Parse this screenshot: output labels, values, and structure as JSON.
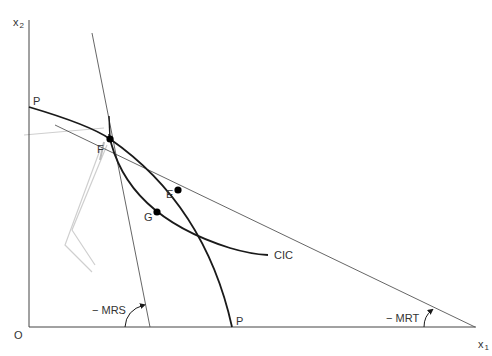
{
  "diagram": {
    "type": "economics-production-possibility",
    "axes": {
      "origin_label": "O",
      "x_label": "x",
      "x_subscript": "1",
      "y_label": "x",
      "y_subscript": "2"
    },
    "curves": {
      "ppf_label_top": "P",
      "ppf_label_bottom": "P",
      "cic_label": "CIC"
    },
    "points": {
      "F": "F",
      "E": "E",
      "G": "G"
    },
    "angles": {
      "mrs_label": "− MRS",
      "mrt_label": "− MRT"
    },
    "colors": {
      "curve": "#1a1a1a",
      "thin_line": "#555555",
      "faint_marks": "#cccccc",
      "text": "#333333"
    }
  }
}
